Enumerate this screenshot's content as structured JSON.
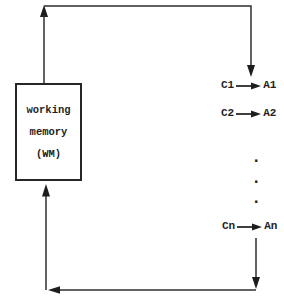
{
  "colors": {
    "background": "#ffffff",
    "ink": "#262626"
  },
  "wm_box": {
    "lines": [
      "working",
      "memory",
      "(WM)"
    ]
  },
  "productions": [
    {
      "condition": "C1",
      "action": "A1"
    },
    {
      "condition": "C2",
      "action": "A2"
    },
    {
      "condition": "Cn",
      "action": "An"
    }
  ],
  "ellipsis_dots": [
    ".",
    ".",
    "."
  ]
}
